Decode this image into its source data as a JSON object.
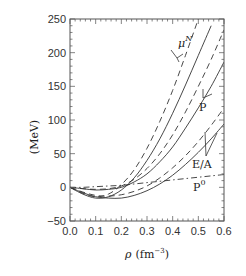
{
  "chart_data": {
    "type": "line",
    "title": "",
    "xlabel": "ρ (fm⁻³)",
    "ylabel": "(MeV)",
    "xlim": [
      0.0,
      0.6
    ],
    "ylim": [
      -50,
      250
    ],
    "grid": false,
    "legend": null,
    "x_ticks": [
      "0.0",
      "0.1",
      "0.2",
      "0.3",
      "0.4",
      "0.5",
      "0.6"
    ],
    "y_ticks": [
      "−50",
      "0",
      "50",
      "100",
      "150",
      "200",
      "250"
    ],
    "annotations": [
      {
        "text": "μ",
        "sup": "N",
        "x": 0.43,
        "y": 222
      },
      {
        "text": "P",
        "x": 0.53,
        "y": 112
      },
      {
        "text": "E/A",
        "x": 0.545,
        "y": 33
      },
      {
        "text": "P",
        "sup": "0",
        "x": 0.545,
        "y": 2
      }
    ],
    "x": [
      0.0,
      0.05,
      0.1,
      0.15,
      0.2,
      0.25,
      0.3,
      0.35,
      0.4,
      0.45,
      0.5,
      0.55,
      0.6
    ],
    "series": [
      {
        "name": "μN (solid)",
        "style": "solid",
        "values": [
          0,
          -10,
          -16,
          -14,
          -4,
          14,
          40,
          72,
          110,
          152,
          196,
          240,
          null
        ]
      },
      {
        "name": "μN (dashed)",
        "style": "dashed",
        "values": [
          0,
          -9,
          -14,
          -10,
          4,
          26,
          58,
          98,
          144,
          196,
          250,
          null,
          null
        ]
      },
      {
        "name": "P (solid)",
        "style": "solid",
        "values": [
          0,
          -2,
          -4,
          -3,
          0,
          8,
          20,
          38,
          60,
          88,
          118,
          150,
          186
        ]
      },
      {
        "name": "P (dashed)",
        "style": "dashed",
        "values": [
          0,
          -2,
          -3,
          -2,
          2,
          12,
          28,
          50,
          78,
          112,
          150,
          190,
          234
        ]
      },
      {
        "name": "E/A (solid)",
        "style": "solid",
        "values": [
          0,
          -8,
          -14,
          -16,
          -16,
          -12,
          -5,
          5,
          18,
          34,
          52,
          72,
          94
        ]
      },
      {
        "name": "E/A (dashed)",
        "style": "dashed",
        "values": [
          0,
          -7,
          -12,
          -13,
          -11,
          -6,
          2,
          14,
          29,
          47,
          68,
          92,
          118
        ]
      },
      {
        "name": "P0 (dash-dot)",
        "style": "dashdot",
        "values": [
          0,
          0,
          1,
          2,
          3,
          5,
          7,
          9,
          11,
          13,
          15,
          17,
          19
        ]
      }
    ]
  },
  "labels": {
    "y_axis": "(MeV)",
    "x_axis_rho": "ρ",
    "x_axis_unit": "(fm",
    "x_axis_exp": "−3",
    "x_axis_close": ")",
    "mu": "μ",
    "mu_sup": "N",
    "p": "P",
    "ea": "E/A",
    "p0": "P",
    "p0_sup": "0"
  }
}
